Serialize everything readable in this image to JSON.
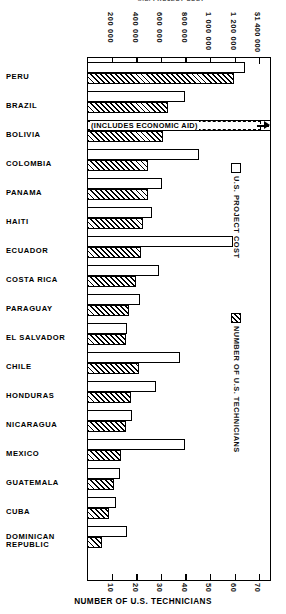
{
  "chart_data": {
    "type": "bar",
    "title": "U.S. PROJECT COST",
    "orientation": "horizontal",
    "grid": false,
    "legend_position": "right",
    "top_axis": {
      "label": "U.S. PROJECT COST",
      "unit": "dollars",
      "ticks": [
        "200 000",
        "400 000",
        "600 000",
        "800 000",
        "1 000 000",
        "1 200 000",
        "$1 400 000"
      ],
      "tick_values": [
        200000,
        400000,
        600000,
        800000,
        1000000,
        1200000,
        1400000
      ],
      "range": [
        0,
        1500000
      ]
    },
    "bottom_axis": {
      "label": "NUMBER OF U.S. TECHNICIANS",
      "ticks": [
        "10",
        "20",
        "30",
        "40",
        "50",
        "60",
        "70"
      ],
      "tick_values": [
        10,
        20,
        30,
        40,
        50,
        60,
        70
      ],
      "range": [
        0,
        75
      ]
    },
    "categories": [
      "PERU",
      "BRAZIL",
      "BOLIVIA",
      "COLOMBIA",
      "PANAMA",
      "HAITI",
      "ECUADOR",
      "COSTA RICA",
      "PARAGUAY",
      "EL SALVADOR",
      "CHILE",
      "HONDURAS",
      "NICARAGUA",
      "MEXICO",
      "GUATEMALA",
      "CUBA",
      "DOMINICAN\nREPUBLIC"
    ],
    "series": [
      {
        "name": "U.S. PROJECT COST",
        "unit": "dollars",
        "style": "open",
        "values": [
          1290000,
          800000,
          1500000,
          910000,
          610000,
          530000,
          1190000,
          590000,
          430000,
          330000,
          760000,
          560000,
          370000,
          800000,
          270000,
          240000,
          330000
        ]
      },
      {
        "name": "NUMBER OF U.S. TECHNICIANS",
        "unit": "technicians",
        "style": "hatched",
        "values": [
          60,
          33,
          31,
          25,
          25,
          23,
          22,
          20,
          17,
          16,
          21,
          18,
          16,
          14,
          11,
          9,
          6
        ]
      }
    ],
    "annotations": [
      {
        "category": "BOLIVIA",
        "text": "(INCLUDES  ECONOMIC  AID)",
        "marker": "arrow-right",
        "meaning": "bar extends beyond chart scale"
      }
    ]
  },
  "legend": {
    "items": [
      {
        "label": "U.S. PROJECT COST",
        "swatch": "open-box"
      },
      {
        "label": "NUMBER OF U.S. TECHNICIANS",
        "swatch": "hatched-box"
      }
    ]
  },
  "bottom_axis_title": "NUMBER OF U.S. TECHNICIANS"
}
